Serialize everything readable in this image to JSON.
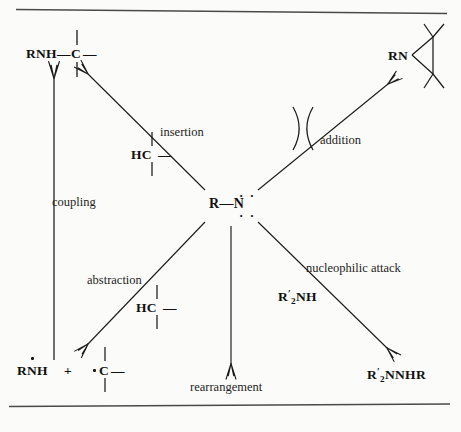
{
  "figure": {
    "center": {
      "label": "R—N",
      "r_text": "R",
      "bond": "—",
      "n_text": "N",
      "lone_pair_top": "· ·",
      "lone_pair_bottom": "· ·",
      "name": "nitrene"
    },
    "pathways": [
      {
        "id": "coupling",
        "label": "coupling",
        "reagent": "",
        "product": "RNH—C—",
        "direction": "up"
      },
      {
        "id": "insertion",
        "label": "insertion",
        "reagent": "HC—",
        "product": "RNH—C—",
        "direction": "up-left"
      },
      {
        "id": "addition",
        "label": "addition",
        "reagent": "alkene",
        "product": "RN",
        "direction": "up-right"
      },
      {
        "id": "abstraction",
        "label": "abstraction",
        "reagent": "HC—",
        "product": "RNH + ·C—",
        "direction": "down-left"
      },
      {
        "id": "rearrangement",
        "label": "rearrangement",
        "reagent": "",
        "product": "",
        "direction": "down"
      },
      {
        "id": "nucleophilic-attack",
        "label": "nucleophilic attack",
        "reagent": "R'2NH",
        "product": "R'2NNHR",
        "direction": "down-right"
      }
    ],
    "products": {
      "insertion_product": {
        "left": "RNH",
        "bond": "—",
        "atom": "C",
        "right": "—"
      },
      "aziridine": {
        "label": "RN"
      },
      "abstraction_left": {
        "label": "RNH"
      },
      "plus": "+",
      "abstraction_right": {
        "atom": "C",
        "right": "—"
      },
      "hydrazine": {
        "r": "R",
        "prime": "′",
        "sub": "2",
        "rest": "NNHR"
      }
    },
    "reagents": {
      "insertion_ch": {
        "left": "HC",
        "right": "—"
      },
      "abstraction_ch": {
        "left": "HC",
        "right": "—"
      },
      "amine": {
        "r": "R",
        "prime": "′",
        "sub": "2",
        "rest": "NH"
      }
    },
    "labels": {
      "coupling": "coupling",
      "insertion": "insertion",
      "addition": "addition",
      "abstraction": "abstraction",
      "rearrangement": "rearrangement",
      "nucleophilic_attack": "nucleophilic attack"
    },
    "colors": {
      "ink": "#1a1a1a",
      "page": "#fbfbf9",
      "rule": "#4a4a4a"
    }
  }
}
